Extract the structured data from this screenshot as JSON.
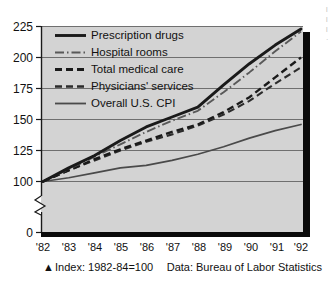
{
  "chart_data": {
    "type": "line",
    "title": "",
    "subtitle": "",
    "xlabel": "",
    "ylabel": "",
    "index_note": "Index: 1982-84=100",
    "source_note": "Data: Bureau of Labor Statistics",
    "marker_glyph": "▲",
    "grid": true,
    "legend_position": "upper-left-inside",
    "axis_break": true,
    "ylim": [
      0,
      225
    ],
    "ytick_labels": [
      "225",
      "200",
      "175",
      "150",
      "125",
      "100",
      "0"
    ],
    "ytick_values": [
      225,
      200,
      175,
      150,
      125,
      100,
      0
    ],
    "categories": [
      "'82",
      "'83",
      "'84",
      "'85",
      "'86",
      "'87",
      "'88",
      "'89",
      "'90",
      "'91",
      "'92"
    ],
    "x": [
      1982,
      1983,
      1984,
      1985,
      1986,
      1987,
      1988,
      1989,
      1990,
      1991,
      1992
    ],
    "series": [
      {
        "name": "Prescription drugs",
        "style": "solid-thick",
        "color": "#1a1a1a",
        "values": [
          100,
          111,
          121,
          133,
          144,
          152,
          160,
          178,
          195,
          210,
          223
        ]
      },
      {
        "name": "Hospital rooms",
        "style": "dash-dot",
        "color": "#595959",
        "values": [
          100,
          110,
          120,
          130,
          140,
          149,
          157,
          172,
          188,
          205,
          221
        ]
      },
      {
        "name": "Total medical care",
        "style": "dashed",
        "color": "#1a1a1a",
        "values": [
          100,
          109,
          118,
          126,
          133,
          140,
          146,
          156,
          168,
          184,
          200
        ]
      },
      {
        "name": "Physicians' services",
        "style": "dash-long",
        "color": "#2b2b2b",
        "values": [
          100,
          109,
          117,
          125,
          132,
          138,
          145,
          154,
          165,
          179,
          192
        ]
      },
      {
        "name": "Overall U.S. CPI",
        "style": "solid-thin",
        "color": "#4a4a4a",
        "values": [
          100,
          103,
          107,
          111,
          113,
          117,
          122,
          128,
          135,
          141,
          146
        ]
      }
    ]
  },
  "colors": {
    "plot_background": "#d3d3d3",
    "grid": "#6f6f6f",
    "axis": "#1a1a1a",
    "shadow": "#0a0a0a",
    "page_background": "#ffffff"
  },
  "edge_fragment": {
    "lines": [
      "l",
      "l",
      "l",
      "·"
    ]
  }
}
